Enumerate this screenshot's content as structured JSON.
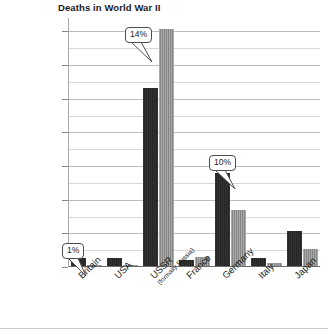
{
  "chart_data": {
    "type": "bar",
    "title": "Deaths in World War II",
    "xlabel": "",
    "ylabel": "",
    "ylim": [
      0,
      14800000
    ],
    "grid": true,
    "legend": "none",
    "categories": [
      "Britain",
      "USA",
      "USSR",
      "France",
      "Germany",
      "Italy",
      "Japan"
    ],
    "category_sublabels": [
      "",
      "",
      "(formally Russia)",
      "",
      "",
      "",
      ""
    ],
    "series": [
      {
        "name": "Military deaths",
        "color": "#262626",
        "values": [
          450000,
          500000,
          10600000,
          350000,
          5500000,
          450000,
          2100000
        ]
      },
      {
        "name": "Civilian deaths",
        "color": "#858585",
        "values": [
          60000,
          20000,
          14100000,
          550000,
          3300000,
          150000,
          1000000
        ]
      }
    ],
    "ytick_labels": [
      "0",
      "2,000,000",
      "4,000,000",
      "6,000,000",
      "8,000,000",
      "10,000,000",
      "12,000,000",
      "14,000,000"
    ],
    "ytick_values": [
      0,
      2000000,
      4000000,
      6000000,
      8000000,
      10000000,
      12000000,
      14000000
    ],
    "minor_tick_interval": 1000000,
    "annotations": [
      {
        "text": "1%",
        "category": "Britain"
      },
      {
        "text": "14%",
        "category": "USSR"
      },
      {
        "text": "10%",
        "category": "Germany"
      }
    ]
  }
}
